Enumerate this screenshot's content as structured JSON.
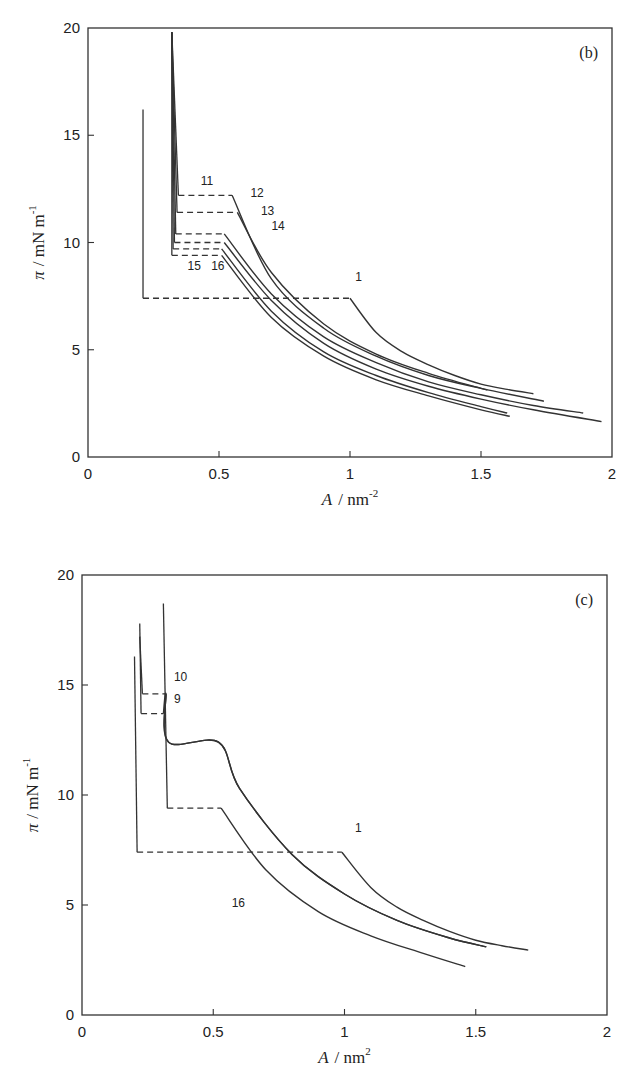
{
  "chart_data": [
    {
      "type": "line",
      "panel_label": "(b)",
      "title": "",
      "xlabel": "A / nm^-2",
      "xlabel_parts": {
        "symbol": "A",
        "unit": "nm",
        "exponent": "-2"
      },
      "ylabel": "π / mN m^-1",
      "ylabel_parts": {
        "symbol": "π",
        "unit": "mN m",
        "exponent": "-1"
      },
      "xlim": [
        0,
        2
      ],
      "ylim": [
        0,
        20
      ],
      "xticks": [
        0,
        0.5,
        1,
        1.5,
        2
      ],
      "xtick_labels": [
        "0",
        "0.5",
        "1",
        "1.5",
        "2"
      ],
      "yticks": [
        0,
        5,
        10,
        15,
        20
      ],
      "ytick_labels": [
        "0",
        "5",
        "10",
        "15",
        "20"
      ],
      "grid": false,
      "legend": "none (curves labelled inline)",
      "series": [
        {
          "name": "1",
          "collapse_area": 0.21,
          "collapse_pressure": 16.2,
          "plateau_pressure": 7.4,
          "plateau_end_area": 1.0,
          "x": [
            0.21,
            0.21,
            1.0,
            1.1,
            1.2,
            1.3,
            1.4,
            1.5,
            1.6,
            1.7
          ],
          "y": [
            16.2,
            7.4,
            7.4,
            5.8,
            4.9,
            4.3,
            3.8,
            3.4,
            3.15,
            2.95
          ]
        },
        {
          "name": "11",
          "collapse_area": 0.32,
          "collapse_pressure": 19.8,
          "plateau_pressure": 12.2,
          "plateau_end_area": 0.55,
          "x": [
            0.32,
            0.345,
            0.55,
            0.7,
            0.9,
            1.1,
            1.3,
            1.5,
            1.74
          ],
          "y": [
            19.8,
            12.2,
            12.2,
            8.3,
            6.0,
            4.7,
            3.8,
            3.2,
            2.6
          ]
        },
        {
          "name": "12",
          "collapse_area": 0.32,
          "collapse_pressure": 19.8,
          "plateau_pressure": 11.4,
          "plateau_end_area": 0.57,
          "x": [
            0.32,
            0.34,
            0.57,
            0.7,
            0.9,
            1.1,
            1.3,
            1.5,
            1.52
          ],
          "y": [
            19.8,
            11.4,
            11.4,
            8.6,
            6.2,
            4.8,
            3.9,
            3.2,
            3.15
          ]
        },
        {
          "name": "13",
          "collapse_area": 0.32,
          "collapse_pressure": 19.8,
          "plateau_pressure": 10.4,
          "plateau_end_area": 0.52,
          "x": [
            0.32,
            0.335,
            0.52,
            0.7,
            0.9,
            1.1,
            1.3,
            1.5,
            1.7,
            1.89
          ],
          "y": [
            19.8,
            10.4,
            10.4,
            7.6,
            5.6,
            4.4,
            3.5,
            2.9,
            2.4,
            2.05
          ]
        },
        {
          "name": "14",
          "collapse_area": 0.32,
          "collapse_pressure": 19.8,
          "plateau_pressure": 10.0,
          "plateau_end_area": 0.52,
          "x": [
            0.32,
            0.33,
            0.52,
            0.7,
            0.9,
            1.1,
            1.3,
            1.5,
            1.7,
            1.96
          ],
          "y": [
            19.8,
            10.0,
            10.0,
            7.3,
            5.3,
            4.1,
            3.3,
            2.7,
            2.2,
            1.65
          ]
        },
        {
          "name": "15",
          "collapse_area": 0.32,
          "collapse_pressure": 19.8,
          "plateau_pressure": 9.7,
          "plateau_end_area": 0.51,
          "x": [
            0.32,
            0.325,
            0.51,
            0.7,
            0.9,
            1.1,
            1.3,
            1.5,
            1.6
          ],
          "y": [
            19.8,
            9.7,
            9.7,
            6.8,
            4.9,
            3.8,
            3.0,
            2.35,
            2.05
          ]
        },
        {
          "name": "16",
          "collapse_area": 0.32,
          "collapse_pressure": 19.8,
          "plateau_pressure": 9.4,
          "plateau_end_area": 0.51,
          "x": [
            0.32,
            0.32,
            0.51,
            0.7,
            0.9,
            1.1,
            1.3,
            1.5,
            1.61
          ],
          "y": [
            19.8,
            9.4,
            9.4,
            6.5,
            4.7,
            3.6,
            2.85,
            2.2,
            1.9
          ]
        }
      ],
      "annotations": [
        {
          "text": "1",
          "x": 1.02,
          "y": 8.2
        },
        {
          "text": "11",
          "x": 0.43,
          "y": 12.7
        },
        {
          "text": "12",
          "x": 0.62,
          "y": 12.1
        },
        {
          "text": "13",
          "x": 0.66,
          "y": 11.3
        },
        {
          "text": "14",
          "x": 0.7,
          "y": 10.6
        },
        {
          "text": "15",
          "x": 0.38,
          "y": 8.7
        },
        {
          "text": "16",
          "x": 0.47,
          "y": 8.7
        }
      ]
    },
    {
      "type": "line",
      "panel_label": "(c)",
      "title": "",
      "xlabel": "A / nm^2",
      "xlabel_parts": {
        "symbol": "A",
        "unit": "nm",
        "exponent": "2"
      },
      "ylabel": "π / mN m^-1",
      "ylabel_parts": {
        "symbol": "π",
        "unit": "mN m",
        "exponent": "-1"
      },
      "xlim": [
        0,
        2
      ],
      "ylim": [
        0,
        20
      ],
      "xticks": [
        0,
        0.5,
        1,
        1.5,
        2
      ],
      "xtick_labels": [
        "0",
        "0.5",
        "1",
        "1.5",
        "2"
      ],
      "yticks": [
        0,
        5,
        10,
        15,
        20
      ],
      "ytick_labels": [
        "0",
        "5",
        "10",
        "15",
        "20"
      ],
      "grid": false,
      "legend": "none (curves labelled inline)",
      "series": [
        {
          "name": "1",
          "collapse_area": 0.2,
          "collapse_pressure": 16.3,
          "plateau_pressure": 7.4,
          "plateau_end_area": 0.99,
          "x": [
            0.2,
            0.21,
            0.99,
            1.1,
            1.2,
            1.3,
            1.4,
            1.5,
            1.6,
            1.7
          ],
          "y": [
            16.3,
            7.4,
            7.4,
            5.8,
            4.9,
            4.3,
            3.8,
            3.4,
            3.15,
            2.95
          ]
        },
        {
          "name": "9",
          "collapse_area": 0.22,
          "collapse_pressure": 17.8,
          "plateau_pressure": 13.7,
          "plateau_end_area": 0.31,
          "x": [
            0.22,
            0.225,
            0.31,
            0.32,
            0.33,
            0.52,
            0.6,
            0.8,
            1.0,
            1.2,
            1.4,
            1.54
          ],
          "y": [
            17.8,
            13.7,
            13.7,
            14.6,
            12.4,
            12.4,
            10.3,
            7.3,
            5.5,
            4.3,
            3.5,
            3.1
          ]
        },
        {
          "name": "10",
          "collapse_area": 0.22,
          "collapse_pressure": 17.8,
          "plateau_pressure": 14.6,
          "plateau_end_area": 0.32,
          "x": [
            0.22,
            0.23,
            0.32,
            0.33,
            0.52,
            0.6,
            0.8,
            1.0,
            1.2,
            1.4,
            1.54
          ],
          "y": [
            17.2,
            14.6,
            14.6,
            12.4,
            12.4,
            10.3,
            7.3,
            5.5,
            4.3,
            3.5,
            3.1
          ]
        },
        {
          "name": "16",
          "collapse_area": 0.32,
          "collapse_pressure": 18.7,
          "plateau_pressure": 9.4,
          "plateau_end_area": 0.53,
          "x": [
            0.31,
            0.325,
            0.53,
            0.7,
            0.9,
            1.1,
            1.3,
            1.46
          ],
          "y": [
            18.7,
            9.4,
            9.4,
            6.6,
            4.7,
            3.6,
            2.8,
            2.2
          ]
        }
      ],
      "annotations": [
        {
          "text": "1",
          "x": 1.04,
          "y": 8.3
        },
        {
          "text": "9",
          "x": 0.35,
          "y": 14.2
        },
        {
          "text": "10",
          "x": 0.35,
          "y": 15.2
        },
        {
          "text": "16",
          "x": 0.57,
          "y": 4.9
        }
      ]
    }
  ],
  "figure": {
    "panels": [
      {
        "id": "b",
        "label": "(b)",
        "box": {
          "left": 88,
          "top": 28,
          "right": 612,
          "bottom": 457
        }
      },
      {
        "id": "c",
        "label": "(c)",
        "box": {
          "left": 82,
          "top": 575,
          "right": 607,
          "bottom": 1015
        }
      }
    ]
  }
}
